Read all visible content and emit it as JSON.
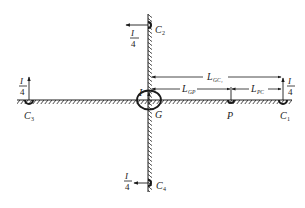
{
  "diagram": {
    "type": "grounding-grid-schematic",
    "colors": {
      "ink": "#1a1a1a",
      "background": "#ffffff"
    },
    "center": {
      "label": "G",
      "current_label": "I"
    },
    "point_p": {
      "label": "P"
    },
    "electrodes": [
      {
        "id": "C1",
        "label_main": "C",
        "label_sub": "1",
        "current_num": "I",
        "current_den": "4",
        "arrow": "up"
      },
      {
        "id": "C2",
        "label_main": "C",
        "label_sub": "2",
        "current_num": "I",
        "current_den": "4",
        "arrow": "left"
      },
      {
        "id": "C3",
        "label_main": "C",
        "label_sub": "3",
        "current_num": "I",
        "current_den": "4",
        "arrow": "up"
      },
      {
        "id": "C4",
        "label_main": "C",
        "label_sub": "4",
        "current_num": "I",
        "current_den": "4",
        "arrow": "left"
      }
    ],
    "dimensions": {
      "gc1": {
        "main": "L",
        "sub": "GC1",
        "sub_display": "GC₁"
      },
      "gp": {
        "main": "L",
        "sub": "GP"
      },
      "pc": {
        "main": "L",
        "sub": "PC"
      }
    }
  }
}
